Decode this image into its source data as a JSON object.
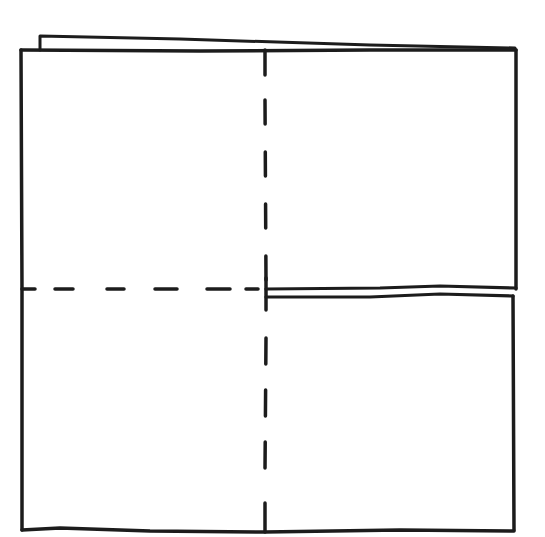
{
  "diagram": {
    "type": "paper-folding",
    "colors": {
      "ink": "#1c1c1c",
      "paper": "#ffffff"
    },
    "stroke_width": 3.5,
    "dash_pattern": "22 22",
    "outer_square": {
      "x1": 22,
      "y1": 50,
      "x2": 515,
      "y2": 530
    },
    "back_layer_top": {
      "points": [
        [
          40,
          50
        ],
        [
          40,
          35
        ],
        [
          370,
          44
        ],
        [
          515,
          48
        ]
      ]
    },
    "vertical_fold": {
      "x": 265,
      "y1": 50,
      "y2": 530,
      "style": "dashed"
    },
    "horizontal_fold_left": {
      "y": 289,
      "x1": 22,
      "x2": 265,
      "style": "dashed"
    },
    "right_edge_double": {
      "upper_y": 289,
      "lower_y": 296,
      "x1": 265,
      "x2": 515,
      "style": "solid"
    }
  }
}
